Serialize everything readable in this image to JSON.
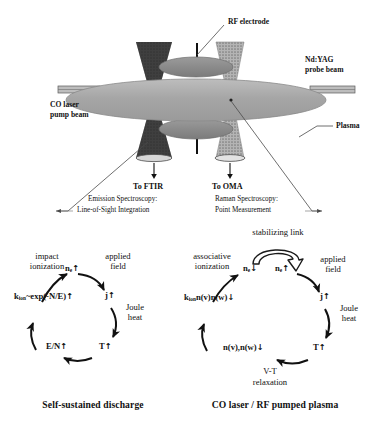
{
  "figure": {
    "apparatus": {
      "labels": {
        "rf_electrode": "RF electrode",
        "ndyag": [
          "Nd:YAG",
          "probe beam"
        ],
        "co_laser": [
          "CO laser",
          "pump beam"
        ],
        "plasma": "Plasma",
        "to_ftir": "To FTIR",
        "to_oma": "To OMA",
        "emission_title": "Emission Spectroscopy:",
        "emission_sub": "Line-of-Sight Integration",
        "raman_title": "Raman Spectroscopy:",
        "raman_sub": "Point Measurement"
      },
      "colors": {
        "plasma_fill": "#a9a9a9",
        "electrode_fill": "#8c8c8c",
        "beam_dark": "#3a3a3a",
        "beam_light": "#9a9a9a",
        "window_fill": "#b5b5b5",
        "line": "#555555"
      }
    },
    "cycles": [
      {
        "id": "self-sustained",
        "caption": "Self-sustained discharge",
        "nodes": {
          "ne": "n",
          "ne_sub": "e",
          "ne_arrow": "↑",
          "j": "j",
          "j_arrow": "↑",
          "t": "T",
          "t_arrow": "↑",
          "en": "E/N",
          "en_arrow": "↑",
          "kion": "k",
          "kion_sub": "ion",
          "kion_rest": "~exp(-N/E)",
          "kion_arrow": "↑"
        },
        "edges": {
          "applied_field": [
            "applied",
            "field"
          ],
          "joule_heat": [
            "Joule",
            "heat"
          ],
          "impact_ionization": [
            "impact",
            "ionization"
          ]
        }
      },
      {
        "id": "co-laser-rf",
        "caption": "CO laser / RF pumped plasma",
        "nodes": {
          "ne_down": "n",
          "ne_down_sub": "e",
          "ne_down_arrow": "↓",
          "ne_up": "n",
          "ne_up_sub": "e",
          "ne_up_arrow": "↑",
          "j": "j",
          "j_arrow": "↑",
          "t": "T",
          "t_arrow": "↑",
          "nvnw": "n(v),n(w)",
          "nvnw_arrow": "↓",
          "kion": "k",
          "kion_sub": "ion",
          "kion_rest": "n(v)n(w)",
          "kion_arrow": "↓"
        },
        "edges": {
          "stabilizing_link": "stabilizing link",
          "applied_field": [
            "applied",
            "field"
          ],
          "joule_heat": [
            "Joule",
            "heat"
          ],
          "vt_relaxation": [
            "V-T",
            "relaxation"
          ],
          "associative_ionization": [
            "associative",
            "ionization"
          ]
        }
      }
    ]
  }
}
